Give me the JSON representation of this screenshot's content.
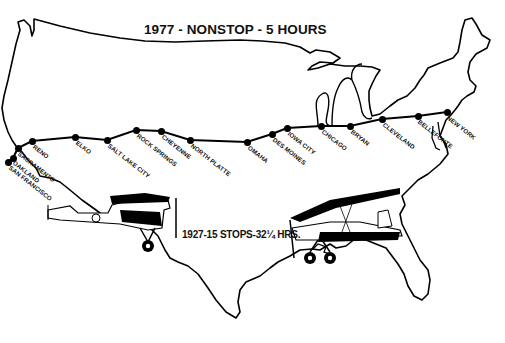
{
  "title": "1977 - NONSTOP - 5 HOURS",
  "caption_1927": "1927-15 STOPS-32¼ HRS.",
  "colors": {
    "ink": "#000000",
    "background": "#ffffff"
  },
  "route": {
    "cities": [
      {
        "name": "SAN FRANCISCO",
        "x": 8,
        "y": 162,
        "lx": 12,
        "ly": 164
      },
      {
        "name": "OAKLAND",
        "x": 13,
        "y": 158,
        "lx": 16,
        "ly": 159
      },
      {
        "name": "SACRAMENTO",
        "x": 18,
        "y": 148,
        "lx": 21,
        "ly": 150
      },
      {
        "name": "RENO",
        "x": 32,
        "y": 141,
        "lx": 36,
        "ly": 143
      },
      {
        "name": "ELKO",
        "x": 75,
        "y": 137,
        "lx": 79,
        "ly": 139
      },
      {
        "name": "SALT LAKE CITY",
        "x": 107,
        "y": 140,
        "lx": 111,
        "ly": 142
      },
      {
        "name": "ROCK SPRINGS",
        "x": 136,
        "y": 130,
        "lx": 140,
        "ly": 132
      },
      {
        "name": "CHEYENNE",
        "x": 161,
        "y": 131,
        "lx": 165,
        "ly": 133
      },
      {
        "name": "NORTH PLATTE",
        "x": 190,
        "y": 140,
        "lx": 194,
        "ly": 142
      },
      {
        "name": "OMAHA",
        "x": 247,
        "y": 142,
        "lx": 251,
        "ly": 144
      },
      {
        "name": "DES MOINES",
        "x": 272,
        "y": 134,
        "lx": 276,
        "ly": 136
      },
      {
        "name": "IOWA CITY",
        "x": 287,
        "y": 128,
        "lx": 291,
        "ly": 130
      },
      {
        "name": "CHICAGO",
        "x": 321,
        "y": 126,
        "lx": 325,
        "ly": 128
      },
      {
        "name": "BRYAN",
        "x": 350,
        "y": 126,
        "lx": 354,
        "ly": 128
      },
      {
        "name": "CLEVELAND",
        "x": 382,
        "y": 119,
        "lx": 386,
        "ly": 121
      },
      {
        "name": "BELLEFONTE",
        "x": 418,
        "y": 116,
        "lx": 421,
        "ly": 118
      },
      {
        "name": "NEW YORK",
        "x": 447,
        "y": 112,
        "lx": 450,
        "ly": 114
      }
    ]
  },
  "icons": {
    "plane_1927_left": "biplane-illustration",
    "plane_1927_right": "biplane-illustration",
    "map": "usa-outline-map"
  }
}
